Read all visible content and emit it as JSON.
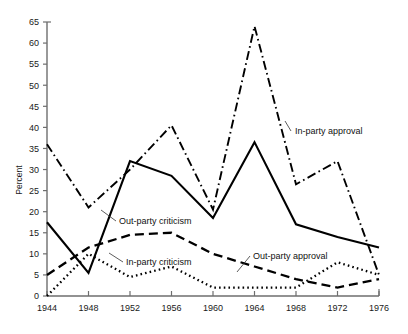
{
  "chart_data": {
    "type": "line",
    "title": "",
    "xlabel": "",
    "ylabel": "Percent",
    "x": [
      1944,
      1948,
      1952,
      1956,
      1960,
      1964,
      1968,
      1972,
      1976
    ],
    "xtick_labels": [
      "1944",
      "1948",
      "1952",
      "1956",
      "1960",
      "1964",
      "1968",
      "1972",
      "1976"
    ],
    "xlim": [
      1944,
      1976
    ],
    "ylim": [
      0,
      65
    ],
    "ytick_labels": [
      "0",
      "5",
      "10",
      "15",
      "20",
      "25",
      "30",
      "35",
      "40",
      "45",
      "50",
      "55",
      "60",
      "65"
    ],
    "yticks": [
      0,
      5,
      10,
      15,
      20,
      25,
      30,
      35,
      40,
      45,
      50,
      55,
      60,
      65
    ],
    "grid": false,
    "legend_position": "inline-annotations",
    "series": [
      {
        "name": "In-party approval",
        "style": "dash-dot",
        "values": [
          36,
          21,
          30,
          40.5,
          20.5,
          64,
          26.5,
          32,
          5
        ]
      },
      {
        "name": "Out-party criticism",
        "style": "solid",
        "values": [
          17.5,
          5.5,
          32,
          28.5,
          18.5,
          36.5,
          17,
          14,
          11.5
        ]
      },
      {
        "name": "Out-party approval",
        "style": "dashed",
        "values": [
          5,
          11.5,
          14.5,
          15,
          10,
          7,
          4,
          2,
          4
        ]
      },
      {
        "name": "In-party criticism",
        "style": "dotted",
        "values": [
          0,
          10,
          4.5,
          7,
          2,
          2,
          2,
          8,
          5
        ]
      }
    ],
    "annotations": [
      {
        "text": "In-party approval",
        "series": "In-party approval"
      },
      {
        "text": "Out-party criticism",
        "series": "Out-party criticism"
      },
      {
        "text": "In-party criticism",
        "series": "In-party criticism"
      },
      {
        "text": "Out-party approval",
        "series": "Out-party approval"
      }
    ]
  },
  "axis": {
    "ylabel": "Percent"
  },
  "colors": {
    "ink": "#000000",
    "axis": "#6e6e6e",
    "background": "#ffffff"
  }
}
